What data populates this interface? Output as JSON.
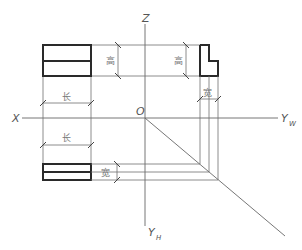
{
  "diagram": {
    "type": "three-view orthographic projection",
    "axes": {
      "z_label": "Z",
      "x_label": "X",
      "origin_label": "O",
      "yw_label": "Y",
      "yw_sub": "W",
      "yh_label": "Y",
      "yh_sub": "H"
    },
    "dimensions": {
      "front_height": "高",
      "side_height": "高",
      "front_length": "长",
      "top_length": "长",
      "side_width": "宽",
      "top_width": "宽"
    },
    "views": [
      "front view (V)",
      "side view (W)",
      "top view (H)"
    ],
    "colors": {
      "outline": "#2a2a2a",
      "projection_line": "#6e6e6e",
      "background": "#ffffff"
    }
  }
}
